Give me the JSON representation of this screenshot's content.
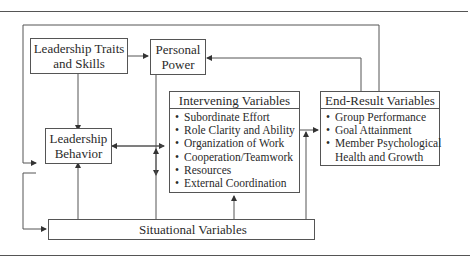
{
  "diagram": {
    "boxes": {
      "traits": {
        "lines": [
          "Leadership Traits",
          "and Skills"
        ]
      },
      "power": {
        "lines": [
          "Personal",
          "Power"
        ]
      },
      "behavior": {
        "lines": [
          "Leadership",
          "Behavior"
        ]
      },
      "intervening": {
        "title": "Intervening Variables",
        "items": [
          "Subordinate Effort",
          "Role Clarity and Ability",
          "Organization of Work",
          "Cooperation/Teamwork",
          "Resources",
          "External Coordination"
        ]
      },
      "endresult": {
        "title": "End-Result Variables",
        "items": [
          "Group Performance",
          "Goal Attainment",
          "Member Psychological",
          "Health and Growth"
        ]
      },
      "situational": {
        "label": "Situational Variables"
      }
    },
    "bullet": "•",
    "colors": {
      "line": "#555555",
      "text": "#2a2a2a",
      "background": "#ffffff"
    }
  }
}
